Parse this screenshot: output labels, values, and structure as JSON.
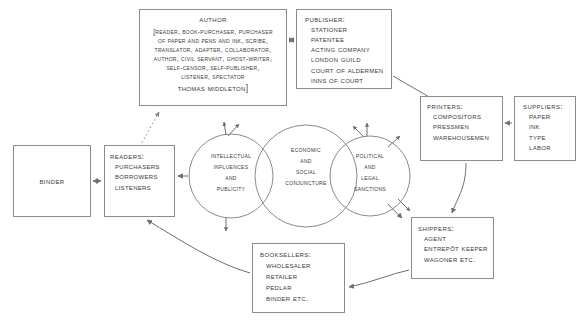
{
  "diagram": {
    "stroke_color": "#8c8c8c",
    "text_color": "#3a3a3a",
    "background_color": "#ffffff",
    "nodes": {
      "author": {
        "title": "Author",
        "lines": [
          "[READER, BOOK-PURCHASER, PURCHASER",
          "OF PAPER AND PENS AND INK, SCRIBE,",
          "TRANSLATOR, ADAPTER, COLLABORATOR,",
          "AUTHOR, CIVIL SERVANT, GHOST-WRITER,",
          "SELF-CENSOR, SELF-PUBLISHER,",
          "LISTENER, SPECTATOR"
        ],
        "signature": "Thomas Middleton]"
      },
      "publisher": {
        "title": "Publisher:",
        "lines": [
          "Stationer",
          "Patentee",
          "Acting Company",
          "London Guild",
          "Court of Aldermen",
          "Inns of Court"
        ]
      },
      "printers": {
        "title": "Printers:",
        "lines": [
          "Compositors",
          "Pressmen",
          "Warehousemen"
        ]
      },
      "suppliers": {
        "title": "Suppliers:",
        "lines": [
          "Paper",
          "Ink",
          "Type",
          "Labor"
        ]
      },
      "shippers": {
        "title": "Shippers:",
        "lines": [
          "Agent",
          "Entrepôt Keeper",
          "Wagoner etc."
        ]
      },
      "booksellers": {
        "title": "Booksellers:",
        "lines": [
          "Wholesaler",
          "Retailer",
          "Pedlar",
          "Binder etc."
        ]
      },
      "readers": {
        "title": "Readers:",
        "lines": [
          "Purchasers",
          "Borrowers",
          "Listeners"
        ]
      },
      "binder": {
        "title": "Binder"
      }
    },
    "circles": {
      "intellectual": {
        "lines": [
          "Intellectual",
          "Influences",
          "and",
          "Publicity"
        ]
      },
      "economic": {
        "lines": [
          "Economic",
          "and",
          "Social",
          "Conjuncture"
        ]
      },
      "political": {
        "lines": [
          "Political",
          "and",
          "Legal",
          "Sanctions"
        ]
      }
    }
  }
}
